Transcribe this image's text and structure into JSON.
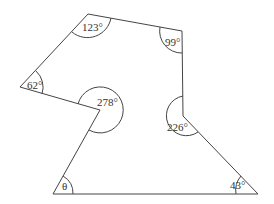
{
  "diagram": {
    "type": "polygon-angles",
    "stroke_color": "#444444",
    "background": "#ffffff",
    "vertices": [
      {
        "id": "top-left",
        "x": 88,
        "y": 14
      },
      {
        "id": "top-right",
        "x": 182,
        "y": 31
      },
      {
        "id": "right-inner",
        "x": 183,
        "y": 116
      },
      {
        "id": "bottom-right",
        "x": 258,
        "y": 194
      },
      {
        "id": "bottom-left",
        "x": 53,
        "y": 194
      },
      {
        "id": "inner",
        "x": 100,
        "y": 110
      },
      {
        "id": "left",
        "x": 20,
        "y": 87
      }
    ],
    "angles": [
      {
        "vertex": "top-left",
        "label": "123°"
      },
      {
        "vertex": "top-right",
        "label": "99°"
      },
      {
        "vertex": "right-inner",
        "label": "226°"
      },
      {
        "vertex": "bottom-right",
        "label": "43°"
      },
      {
        "vertex": "bottom-left",
        "label": "θ"
      },
      {
        "vertex": "inner",
        "label": "278°"
      },
      {
        "vertex": "left",
        "label": "62°"
      }
    ]
  }
}
